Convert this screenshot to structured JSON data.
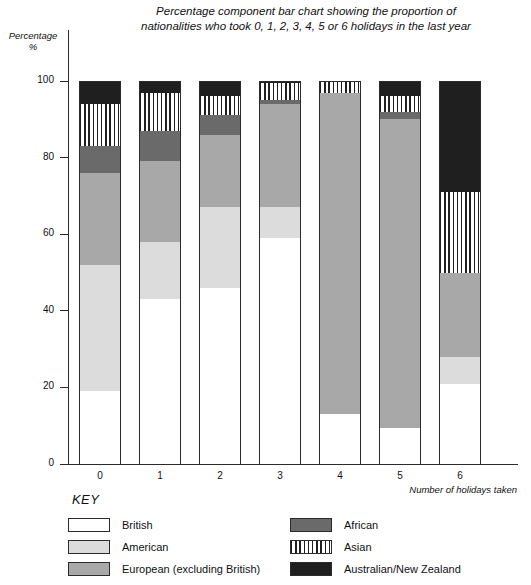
{
  "chart_data": {
    "type": "bar",
    "title": "Percentage component bar chart showing the proportion of nationalities who took 0, 1, 2, 3, 4, 5 or 6 holidays in the last year",
    "title_line1": "Percentage component bar chart showing the proportion of",
    "title_line2": "nationalities who took 0, 1, 2, 3, 4, 5 or 6 holidays in the last year",
    "stacked": true,
    "stacked_percent": true,
    "xlabel": "Number of holidays taken",
    "ylabel": "Percentage",
    "ylabel_line2": "%",
    "ylim": [
      0,
      100
    ],
    "yticks": [
      0,
      20,
      40,
      60,
      80,
      100
    ],
    "categories": [
      "0",
      "1",
      "2",
      "3",
      "4",
      "5",
      "6"
    ],
    "grid": false,
    "legend_position": "below-left",
    "legend_title": "KEY",
    "series": [
      {
        "name": "British",
        "fill": "white",
        "color": "#ffffff",
        "values": [
          19,
          43,
          46,
          59,
          13,
          9.5,
          21
        ]
      },
      {
        "name": "American",
        "fill": "light-grey",
        "color": "#dcdcdc",
        "values": [
          33,
          15,
          21,
          8,
          0,
          0,
          7
        ]
      },
      {
        "name": "European (excluding British)",
        "fill": "mid-grey",
        "color": "#a8a8a8",
        "values": [
          24,
          21,
          19,
          27,
          84,
          80.5,
          22
        ]
      },
      {
        "name": "African",
        "fill": "dark-grey",
        "color": "#6a6a6a",
        "values": [
          7,
          8,
          5,
          1,
          0,
          2,
          0
        ]
      },
      {
        "name": "Asian",
        "fill": "striped",
        "color": "#ffffff",
        "values": [
          11,
          10,
          5,
          4.5,
          3,
          4,
          21
        ]
      },
      {
        "name": "Australian/New Zealand",
        "fill": "black",
        "color": "#1f1f1f",
        "values": [
          6,
          3,
          4,
          0.5,
          0,
          4,
          29
        ]
      }
    ]
  },
  "legend": {
    "title": "KEY",
    "left_items": [
      {
        "label": "British",
        "swatch": "white"
      },
      {
        "label": "American",
        "swatch": "light-grey"
      },
      {
        "label": "European (excluding British)",
        "swatch": "mid-grey"
      }
    ],
    "right_items": [
      {
        "label": "African",
        "swatch": "dark-grey"
      },
      {
        "label": "Asian",
        "swatch": "striped"
      },
      {
        "label": "Australian/New Zealand",
        "swatch": "black"
      }
    ]
  },
  "colors": {
    "british": "#ffffff",
    "american": "#dcdcdc",
    "european": "#a8a8a8",
    "african": "#6a6a6a",
    "asian_stripe": "#1f1f1f",
    "anz": "#1f1f1f",
    "axis": "#2b2b2b",
    "background": "#ffffff"
  }
}
